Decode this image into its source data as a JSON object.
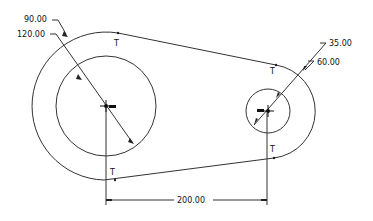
{
  "drawing": {
    "type": "sketch-dimensions",
    "dimensions": {
      "large_outer_diameter": "120.00",
      "large_inner_diameter": "90.00",
      "small_inner_diameter": "35.00",
      "small_outer_diameter": "60.00",
      "center_distance": "200.00"
    },
    "tangent_marker": "T",
    "colors": {
      "line": "#222222",
      "background": "#ffffff"
    }
  }
}
